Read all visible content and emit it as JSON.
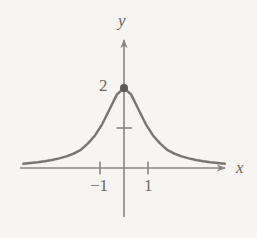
{
  "figure": {
    "name": "bell-shaped-curve-graph",
    "background_color": "#f7f5f1",
    "ink_color": "#7a7570",
    "axis_color": "#8a857f",
    "point_color": "#5d5852"
  },
  "axes": {
    "x_label": "x",
    "y_label": "y",
    "origin_px": [
      124,
      168
    ],
    "x_unit_px": 24,
    "y_unit_px": 40,
    "x_axis_y_px": 168,
    "y_axis_x_px": 124,
    "x_axis_start_px": 20,
    "x_axis_end_px": 228,
    "y_axis_top_px": 33,
    "y_axis_bottom_px": 217
  },
  "ticks": {
    "x": [
      {
        "value": -1,
        "label": "−1",
        "px": 100
      },
      {
        "value": 1,
        "label": "1",
        "px": 148
      }
    ],
    "y": [
      {
        "value": 1,
        "label": "",
        "px": 128
      },
      {
        "value": 2,
        "label": "2",
        "px": 88
      }
    ]
  },
  "annotations": [
    {
      "name": "maximum-point",
      "kind": "filled-dot",
      "x": 0,
      "y": 2,
      "px": [
        124,
        88
      ],
      "radius_px": 4
    }
  ],
  "chart_data": {
    "type": "line",
    "title": "",
    "xlabel": "x",
    "ylabel": "y",
    "grid": false,
    "legend": null,
    "xlim": [
      -4.2,
      4.2
    ],
    "ylim": [
      -0.2,
      2.35
    ],
    "x_ticks": [
      -1,
      1
    ],
    "x_tick_labels": [
      "−1",
      "1"
    ],
    "y_ticks": [
      1,
      2
    ],
    "y_tick_labels": [
      "",
      "2"
    ],
    "series": [
      {
        "name": "y = 2/(1 + x^2)",
        "expression": "2/(1+x^2)",
        "color": "#7a7570",
        "x": [
          -4.2,
          -3.9,
          -3.6,
          -3.3,
          -3.0,
          -2.7,
          -2.4,
          -2.1,
          -1.8,
          -1.5,
          -1.2,
          -0.9,
          -0.6,
          -0.3,
          0.0,
          0.3,
          0.6,
          0.9,
          1.2,
          1.5,
          1.8,
          2.1,
          2.4,
          2.7,
          3.0,
          3.3,
          3.6,
          3.9,
          4.2
        ],
        "values": [
          0.107,
          0.124,
          0.144,
          0.169,
          0.2,
          0.239,
          0.29,
          0.358,
          0.452,
          0.615,
          0.82,
          1.105,
          1.471,
          1.835,
          2.0,
          1.835,
          1.471,
          1.105,
          0.82,
          0.615,
          0.452,
          0.358,
          0.29,
          0.239,
          0.2,
          0.169,
          0.144,
          0.124,
          0.107
        ]
      }
    ],
    "annotations": [
      {
        "text": "2",
        "x": 0,
        "y": 2,
        "note": "y-intercept / maximum value label"
      }
    ]
  }
}
